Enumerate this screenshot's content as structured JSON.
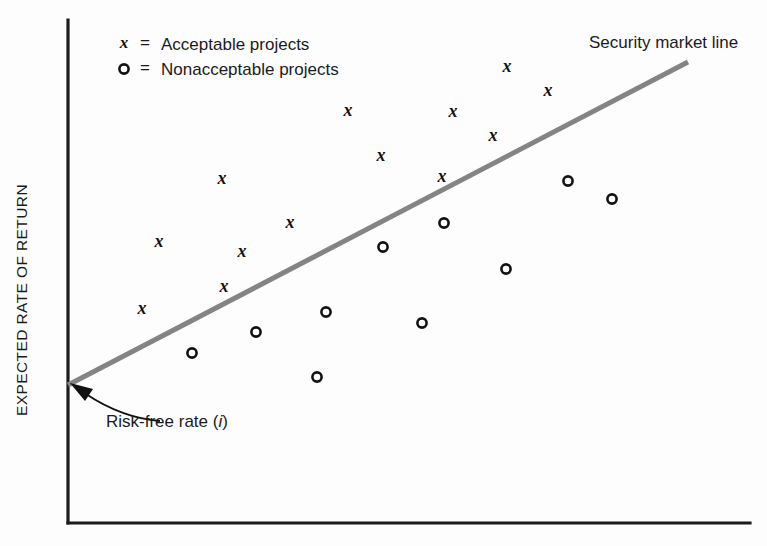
{
  "figure": {
    "background_color": "#fdfdfd",
    "axis_color": "#1b1b1b",
    "line_color": "#848484",
    "marker_color": "#111111"
  },
  "legend": {
    "position": "top-left",
    "equals_sign": "=",
    "entries": [
      {
        "symbol": "x",
        "label": "Acceptable projects"
      },
      {
        "symbol": "o",
        "label": "Nonacceptable projects"
      }
    ]
  },
  "annotations": {
    "sml_label": "Security market line",
    "risk_free_label_prefix": "Risk-free rate (",
    "risk_free_label_symbol": "i",
    "risk_free_label_suffix": ")"
  },
  "axes": {
    "ylabel": "EXPECTED RATE OF RETURN",
    "xlabel": "",
    "ticks_visible": false,
    "grid": false
  },
  "chart_data": {
    "type": "scatter",
    "xlabel": "",
    "ylabel": "EXPECTED RATE OF RETURN",
    "grid": false,
    "legend_position": "top-left",
    "axis_ranges": {
      "x_pixel": [
        68,
        750
      ],
      "y_pixel": [
        20,
        523
      ]
    },
    "reference_line": {
      "name": "Security market line",
      "color": "#848484",
      "start_pixel": [
        68,
        385
      ],
      "end_pixel": [
        688,
        62
      ],
      "intercept_label": "Risk-free rate (i)"
    },
    "series": [
      {
        "name": "Acceptable projects",
        "marker": "x",
        "count": 12,
        "points_pixel": [
          [
            142,
            310
          ],
          [
            159,
            243
          ],
          [
            222,
            180
          ],
          [
            224,
            288
          ],
          [
            242,
            253
          ],
          [
            290,
            224
          ],
          [
            348,
            112
          ],
          [
            381,
            157
          ],
          [
            442,
            178
          ],
          [
            453,
            113
          ],
          [
            493,
            137
          ],
          [
            507,
            68
          ],
          [
            548,
            92
          ]
        ]
      },
      {
        "name": "Nonacceptable projects",
        "marker": "o",
        "count": 11,
        "points_pixel": [
          [
            192,
            353
          ],
          [
            256,
            332
          ],
          [
            317,
            377
          ],
          [
            326,
            312
          ],
          [
            383,
            247
          ],
          [
            422,
            323
          ],
          [
            444,
            223
          ],
          [
            506,
            269
          ],
          [
            568,
            181
          ],
          [
            612,
            199
          ]
        ]
      }
    ]
  }
}
